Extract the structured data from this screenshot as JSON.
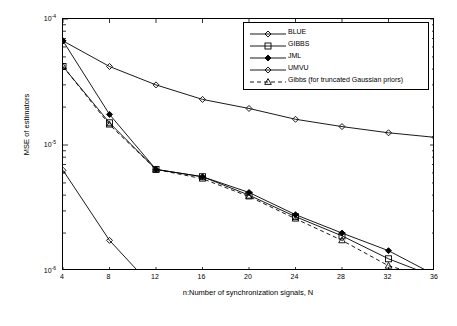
{
  "chart_data": {
    "type": "line",
    "title": "",
    "xlabel": "n:Number of synchronization signals, N",
    "ylabel": "MSE of estimators",
    "x": [
      4,
      8,
      12,
      16,
      20,
      24,
      28,
      32,
      36
    ],
    "xticks": [
      "4",
      "8",
      "12",
      "16",
      "20",
      "24",
      "28",
      "32",
      "36"
    ],
    "xlim": [
      4,
      36
    ],
    "ylim": [
      1e-06,
      0.0001
    ],
    "yscale": "log",
    "yticks": [
      "10^-4",
      "10^-5",
      "10^-6"
    ],
    "ytick_values": [
      0.0001,
      1e-05,
      1e-06
    ],
    "grid": false,
    "legend_position": "top-right",
    "series": [
      {
        "name": "BLUE",
        "marker": "diamond",
        "linestyle": "solid",
        "values": [
          6.7e-05,
          4.2e-05,
          3e-05,
          2.3e-05,
          1.95e-05,
          1.6e-05,
          1.4e-05,
          1.25e-05,
          1.15e-05
        ]
      },
      {
        "name": "GIBBS",
        "marker": "square",
        "linestyle": "solid",
        "values": [
          4.2e-05,
          1.5e-05,
          6.4e-06,
          5.6e-06,
          4e-06,
          2.7e-06,
          1.9e-06,
          1.25e-06,
          9e-07
        ]
      },
      {
        "name": "JML",
        "marker": "filled-diamond",
        "linestyle": "solid",
        "values": [
          6.7e-05,
          1.75e-05,
          6.4e-06,
          5.6e-06,
          4.2e-06,
          2.8e-06,
          2e-06,
          1.45e-06,
          9.3e-07
        ]
      },
      {
        "name": "UMVU",
        "marker": "diamond",
        "linestyle": "solid",
        "values": [
          6.3e-06,
          1.75e-06,
          7e-07,
          3.8e-07,
          2.5e-07,
          1.8e-07,
          1.3e-07,
          1.15e-07,
          1e-07
        ]
      },
      {
        "name": "Gibbs (for truncated Gaussian priors)",
        "marker": "triangle",
        "linestyle": "dashed",
        "values": [
          4.2e-05,
          1.45e-05,
          6.4e-06,
          5.4e-06,
          3.9e-06,
          2.6e-06,
          1.75e-06,
          1.1e-06,
          8.7e-07
        ]
      }
    ]
  }
}
